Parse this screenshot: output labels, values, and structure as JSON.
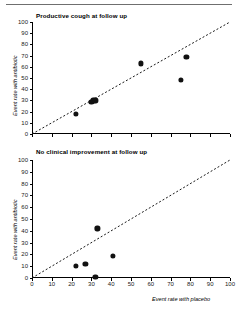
{
  "figure": {
    "divider_present": true,
    "point_color": "#111111",
    "line_color": "#1a1a1a",
    "axis_color": "#000000",
    "background": "#ffffff"
  },
  "axis_titles": {
    "x": "Event rate with placebo",
    "y": "Event rate with antibiotic"
  },
  "ticks": {
    "x": [
      "0",
      "10",
      "20",
      "30",
      "40",
      "50",
      "60",
      "70",
      "80",
      "90",
      "100"
    ],
    "y": [
      "0",
      "10",
      "20",
      "30",
      "40",
      "50",
      "60",
      "70",
      "80",
      "90",
      "100"
    ]
  },
  "chart_data": [
    {
      "type": "scatter",
      "title": "Productive cough at follow up",
      "xlabel": "Event rate with placebo",
      "ylabel": "Event rate with antibiotic",
      "xlim": [
        0,
        100
      ],
      "ylim": [
        0,
        100
      ],
      "xticks": [
        0,
        10,
        20,
        30,
        40,
        50,
        60,
        70,
        80,
        90,
        100
      ],
      "yticks": [
        0,
        10,
        20,
        30,
        40,
        50,
        60,
        70,
        80,
        90,
        100
      ],
      "grid": false,
      "legend": "none",
      "points": [
        {
          "x": 22,
          "y": 18
        },
        {
          "x": 30,
          "y": 29
        },
        {
          "x": 31,
          "y": 30
        },
        {
          "x": 32,
          "y": 30
        },
        {
          "x": 55,
          "y": 63
        },
        {
          "x": 75,
          "y": 48
        },
        {
          "x": 78,
          "y": 69
        }
      ],
      "annotations": [
        {
          "type": "line-of-equality",
          "style": "dashed",
          "from": [
            0,
            0
          ],
          "to": [
            100,
            100
          ]
        }
      ]
    },
    {
      "type": "scatter",
      "title": "No clinical improvement at follow up",
      "xlabel": "Event rate with placebo",
      "ylabel": "Event rate with antibiotic",
      "xlim": [
        0,
        100
      ],
      "ylim": [
        0,
        100
      ],
      "xticks": [
        0,
        10,
        20,
        30,
        40,
        50,
        60,
        70,
        80,
        90,
        100
      ],
      "yticks": [
        0,
        10,
        20,
        30,
        40,
        50,
        60,
        70,
        80,
        90,
        100
      ],
      "grid": false,
      "legend": "none",
      "points": [
        {
          "x": 22,
          "y": 10
        },
        {
          "x": 27,
          "y": 12
        },
        {
          "x": 32,
          "y": 1
        },
        {
          "x": 33,
          "y": 42
        },
        {
          "x": 41,
          "y": 19
        }
      ],
      "annotations": [
        {
          "type": "line-of-equality",
          "style": "dashed",
          "from": [
            0,
            0
          ],
          "to": [
            100,
            100
          ]
        }
      ]
    }
  ]
}
